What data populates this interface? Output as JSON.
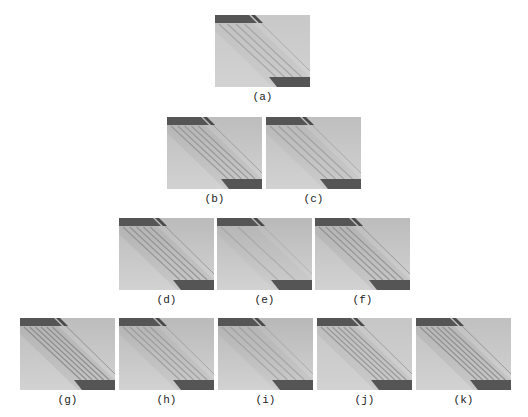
{
  "figure": {
    "panels": [
      {
        "id": "a",
        "label": "(a)",
        "x": 215,
        "y": 15,
        "bg": "#c8c8c8",
        "stripes": 4,
        "contrast": 0.55
      },
      {
        "id": "b",
        "label": "(b)",
        "x": 167,
        "y": 117,
        "bg": "#bdbdbd",
        "stripes": 5,
        "contrast": 0.7
      },
      {
        "id": "c",
        "label": "(c)",
        "x": 266,
        "y": 117,
        "bg": "#bfbfbf",
        "stripes": 4,
        "contrast": 0.55
      },
      {
        "id": "d",
        "label": "(d)",
        "x": 119,
        "y": 218,
        "bg": "#bbbbbb",
        "stripes": 5,
        "contrast": 0.8
      },
      {
        "id": "e",
        "label": "(e)",
        "x": 217,
        "y": 218,
        "bg": "#b9b9b9",
        "stripes": 2,
        "contrast": 0.4
      },
      {
        "id": "f",
        "label": "(f)",
        "x": 315,
        "y": 218,
        "bg": "#bcbcbc",
        "stripes": 5,
        "contrast": 0.8
      },
      {
        "id": "g",
        "label": "(g)",
        "x": 20,
        "y": 318,
        "bg": "#bdbdbd",
        "stripes": 6,
        "contrast": 0.9
      },
      {
        "id": "h",
        "label": "(h)",
        "x": 119,
        "y": 318,
        "bg": "#bababa",
        "stripes": 5,
        "contrast": 0.6
      },
      {
        "id": "i",
        "label": "(i)",
        "x": 218,
        "y": 318,
        "bg": "#b8b8b8",
        "stripes": 4,
        "contrast": 0.5
      },
      {
        "id": "j",
        "label": "(j)",
        "x": 317,
        "y": 318,
        "bg": "#c6c6c6",
        "stripes": 6,
        "contrast": 0.75
      },
      {
        "id": "k",
        "label": "(k)",
        "x": 416,
        "y": 318,
        "bg": "#c0c0c0",
        "stripes": 6,
        "contrast": 0.85
      }
    ],
    "colors": {
      "bar_dark": "#555555",
      "stripe": "#8a8a8a"
    }
  }
}
